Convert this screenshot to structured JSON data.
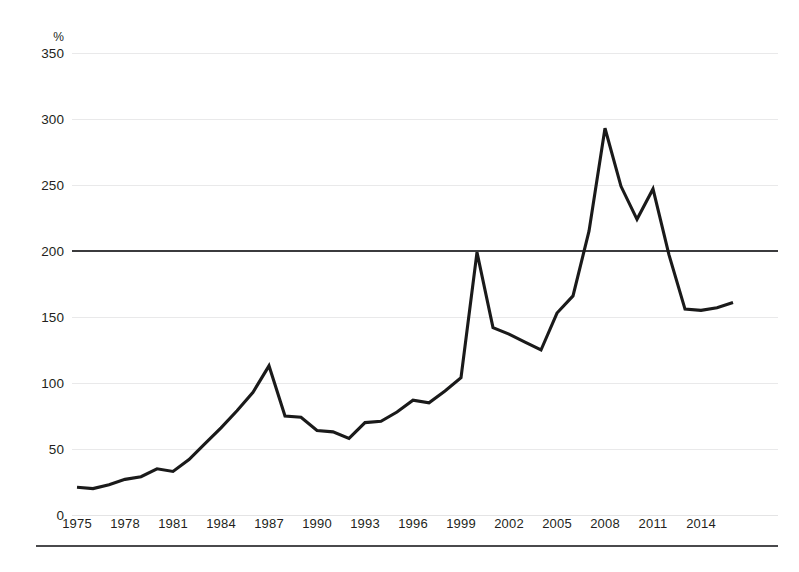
{
  "chart_data": {
    "type": "line",
    "title": "",
    "subtitle": "",
    "xlabel": "",
    "ylabel": "%",
    "y_unit_label": "%",
    "x": [
      1975,
      1976,
      1977,
      1978,
      1979,
      1980,
      1981,
      1982,
      1983,
      1984,
      1985,
      1986,
      1987,
      1988,
      1989,
      1990,
      1991,
      1992,
      1993,
      1994,
      1995,
      1996,
      1997,
      1998,
      1999,
      2000,
      2001,
      2002,
      2003,
      2004,
      2005,
      2006,
      2007,
      2008,
      2009,
      2010,
      2011,
      2012,
      2013,
      2014,
      2015,
      2016
    ],
    "values": [
      21,
      20,
      23,
      27,
      29,
      35,
      33,
      42,
      54,
      66,
      79,
      93,
      113,
      75,
      74,
      64,
      63,
      58,
      70,
      71,
      78,
      87,
      85,
      94,
      104,
      199,
      142,
      137,
      131,
      125,
      153,
      166,
      215,
      293,
      249,
      224,
      247,
      197,
      156,
      155,
      157,
      161
    ],
    "series": [
      {
        "name": "",
        "values": [
          21,
          20,
          23,
          27,
          29,
          35,
          33,
          42,
          54,
          66,
          79,
          93,
          113,
          75,
          74,
          64,
          63,
          58,
          70,
          71,
          78,
          87,
          85,
          94,
          104,
          199,
          142,
          137,
          131,
          125,
          153,
          166,
          215,
          293,
          249,
          224,
          247,
          197,
          156,
          155,
          157,
          161
        ]
      }
    ],
    "xlim": [
      1975,
      2016
    ],
    "ylim": [
      0,
      350
    ],
    "ytick_values": [
      350,
      300,
      250,
      200,
      150,
      100,
      50,
      0
    ],
    "ytick_labels": [
      "350",
      "300",
      "250",
      "200",
      "150",
      "100",
      "50",
      "0"
    ],
    "xtick_values": [
      1975,
      1978,
      1981,
      1984,
      1987,
      1990,
      1993,
      1996,
      1999,
      2002,
      2005,
      2008,
      2011,
      2014
    ],
    "xtick_labels": [
      "1975",
      "1978",
      "1981",
      "1984",
      "1987",
      "1990",
      "1993",
      "1996",
      "1999",
      "2002",
      "2005",
      "2008",
      "2011",
      "2014"
    ],
    "grid": true,
    "grid_axis": "y",
    "legend": false,
    "legend_position": "none",
    "reference_lines": [
      {
        "name": "200-percent-reference",
        "value": 200,
        "orientation": "horizontal"
      }
    ],
    "colors": {
      "series_line": "#1a1a1a",
      "gridline": "#e9e9ea",
      "reference_line": "#3b3b3d",
      "axis_rule": "#4a4a4c",
      "text": "#231f20",
      "background": "#ffffff"
    }
  }
}
